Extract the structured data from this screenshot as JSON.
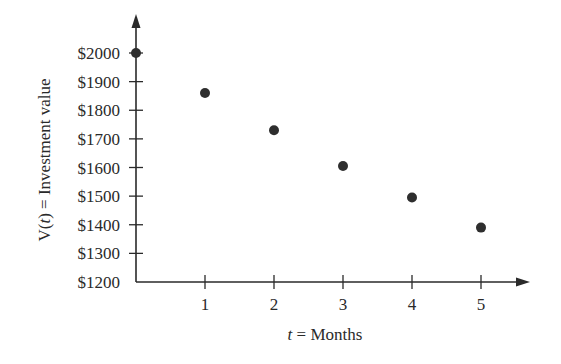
{
  "chart_data": {
    "type": "scatter",
    "title": "",
    "xlabel": "t = Months",
    "xlabel_var": "t",
    "xlabel_rest": " = Months",
    "ylabel": "V(t) = Investment value",
    "ylabel_parts": {
      "v": "V(",
      "t": "t",
      "rest": ") = Investment value"
    },
    "x": [
      0,
      1,
      2,
      3,
      4,
      5
    ],
    "y": [
      2000,
      1860,
      1730,
      1605,
      1495,
      1390
    ],
    "x_ticks": [
      "1",
      "2",
      "3",
      "4",
      "5"
    ],
    "y_ticks": [
      "$2000",
      "$1900",
      "$1800",
      "$1700",
      "$1600",
      "$1500",
      "$1400",
      "$1300",
      "$1200"
    ],
    "xlim": [
      0,
      5.5
    ],
    "ylim": [
      1200,
      2000
    ],
    "grid": false,
    "legend": null,
    "colors": {
      "axis": "#2a2a2a",
      "point": "#2e2e2e",
      "background": "#ffffff"
    }
  }
}
